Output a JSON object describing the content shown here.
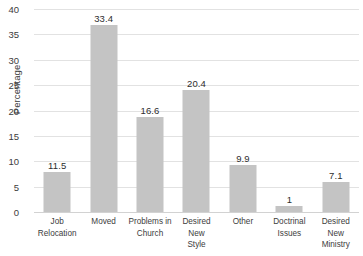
{
  "chart_data": {
    "type": "bar",
    "title": "",
    "xlabel": "",
    "ylabel": "Percentage",
    "ylim": [
      0,
      40
    ],
    "yticks": [
      0,
      5,
      10,
      15,
      20,
      25,
      30,
      35,
      40
    ],
    "grid": true,
    "legend": false,
    "bar_color": "#c4c4c4",
    "gridline_color": "#e2e2e2",
    "label_color": "#3c3c3c",
    "categories": [
      "Job\nRelocation",
      "Moved",
      "Problems in\nChurch",
      "Desired New\nStyle",
      "Other",
      "Doctrinal\nIssues",
      "Desired New\nMinistry"
    ],
    "values": [
      11.5,
      33.4,
      16.6,
      20.4,
      9.9,
      1,
      7.1
    ],
    "value_labels": [
      "11.5",
      "33.4",
      "16.6",
      "20.4",
      "9.9",
      "1",
      "7.1"
    ],
    "bar_pixel_tops": [
      172,
      25,
      117,
      90,
      165,
      206,
      182
    ],
    "tick_labels": [
      "40",
      "35",
      "30",
      "25",
      "20",
      "15",
      "10",
      "5",
      "0"
    ],
    "tick_pixel_y": [
      9,
      34.4,
      59.8,
      85.2,
      110.6,
      136,
      161.4,
      186.8,
      212.2
    ]
  }
}
